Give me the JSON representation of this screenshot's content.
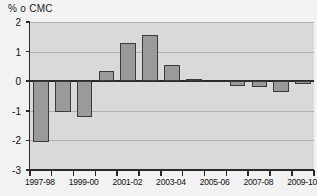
{
  "chart_data": {
    "type": "bar",
    "title": "% o CMC",
    "xlabel": "",
    "ylabel": "% o CMC",
    "ylim": [
      -3,
      2
    ],
    "ytick_labels": [
      "2",
      "1",
      "0",
      "-1",
      "-2",
      "-3"
    ],
    "ytick_values": [
      2,
      1,
      0,
      -1,
      -2,
      -3
    ],
    "grid": true,
    "legend": "none",
    "categories": [
      "1997-98",
      "1998-99",
      "1999-00",
      "2000-01",
      "2001-02",
      "2002-03",
      "2003-04",
      "2004-05",
      "2005-06",
      "2006-07",
      "2007-08",
      "2008-09",
      "2009-10"
    ],
    "xtick_labels": [
      "1997-98",
      "1999-00",
      "2001-02",
      "2003-04",
      "2005-06",
      "2007-08",
      "2009-10"
    ],
    "values": [
      -2.05,
      -1.05,
      -1.2,
      0.35,
      1.3,
      1.55,
      0.55,
      0.08,
      0.0,
      -0.15,
      -0.2,
      -0.35,
      -0.1
    ],
    "series": [
      {
        "name": "% o CMC",
        "values": [
          -2.05,
          -1.05,
          -1.2,
          0.35,
          1.3,
          1.55,
          0.55,
          0.08,
          0.0,
          -0.15,
          -0.2,
          -0.35,
          -0.1
        ]
      }
    ],
    "colors": {
      "bar_fill": "#9a9a9a",
      "bar_stroke": "#3b3b3b",
      "plot_background": "#d9d9d9",
      "figure_background": "#f2f2f2",
      "gridline": "#b0b0b0",
      "axis": "#2b2b2b",
      "text": "#111111"
    }
  }
}
